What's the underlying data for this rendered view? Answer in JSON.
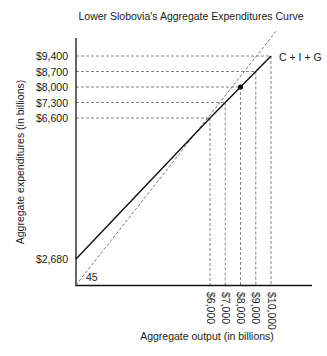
{
  "chart_data": {
    "type": "line",
    "title": "Lower Slobovia's Aggregate Expenditures Curve",
    "xlabel": "Aggregate output (in billions)",
    "ylabel": "Aggregate expenditures (in billions)",
    "x_ticks": [
      6000,
      7000,
      8000,
      9000,
      10000
    ],
    "x_tick_labels": [
      "$6,000",
      "$7,000",
      "$8,000",
      "$9,000",
      "$10,000"
    ],
    "y_ticks": [
      2680,
      6600,
      7300,
      8000,
      8700,
      9400
    ],
    "y_tick_labels": [
      "$2,680",
      "$6,600",
      "$7,300",
      "$8,000",
      "$8,700",
      "$9,400"
    ],
    "series": [
      {
        "name": "C + I + G",
        "style": "solid",
        "x": [
          0,
          6000,
          7000,
          8000,
          9000,
          10000
        ],
        "y": [
          2680,
          6600,
          7300,
          8000,
          8700,
          9400
        ]
      },
      {
        "name": "45",
        "style": "dashed",
        "x": [
          0,
          10000
        ],
        "y": [
          0,
          10000
        ]
      }
    ],
    "equilibrium": {
      "x": 8000,
      "y": 8000
    },
    "guide_lines": "dashed",
    "grid": false,
    "legend": "none",
    "annotations": [
      {
        "text": "C + I + G",
        "position": "end of solid line (top-right)"
      },
      {
        "text": "45",
        "position": "near origin"
      }
    ],
    "colors": {
      "line": "#111111",
      "guide": "#666666"
    }
  }
}
